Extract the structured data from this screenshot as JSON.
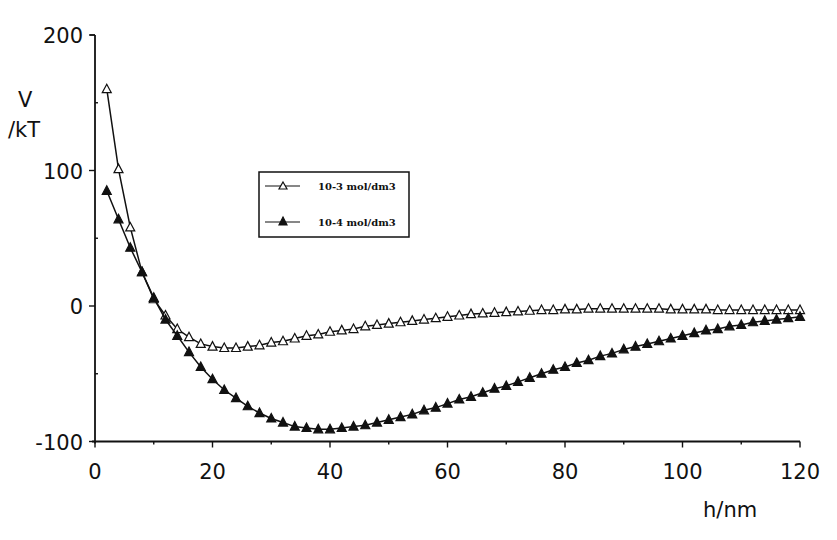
{
  "chart_data": {
    "type": "line",
    "title": "",
    "xlabel": "h/nm",
    "ylabel_line1": "V",
    "ylabel_line2": "/kT",
    "xlim": [
      0,
      120
    ],
    "ylim": [
      -100,
      200
    ],
    "xticks": [
      0,
      20,
      40,
      60,
      80,
      100,
      120
    ],
    "xtick_labels": [
      "0",
      "20",
      "40",
      "60",
      "80",
      "100",
      "120"
    ],
    "yticks": [
      -100,
      0,
      100,
      200
    ],
    "ytick_labels": [
      "-100",
      "0",
      "100",
      "200"
    ],
    "grid": false,
    "legend_position": "upper-center-left (boxed)",
    "x": [
      2,
      4,
      6,
      8,
      10,
      12,
      14,
      16,
      18,
      20,
      22,
      24,
      26,
      28,
      30,
      32,
      34,
      36,
      38,
      40,
      42,
      44,
      46,
      48,
      50,
      52,
      54,
      56,
      58,
      60,
      62,
      64,
      66,
      68,
      70,
      72,
      74,
      76,
      78,
      80,
      82,
      84,
      86,
      88,
      90,
      92,
      94,
      96,
      98,
      100,
      102,
      104,
      106,
      108,
      110,
      112,
      114,
      116,
      118,
      120
    ],
    "series": [
      {
        "name": "10-3 mol/dm3",
        "marker": "open-triangle",
        "values": [
          160,
          101,
          58,
          25,
          5,
          -7,
          -17,
          -23,
          -28,
          -30,
          -31,
          -31,
          -30,
          -29,
          -27,
          -26,
          -24,
          -22,
          -21,
          -19,
          -18,
          -17,
          -15,
          -14,
          -13,
          -12,
          -11,
          -10,
          -9,
          -8,
          -7,
          -6,
          -5.5,
          -5,
          -4.5,
          -4,
          -3.5,
          -3,
          -3,
          -2.5,
          -2.5,
          -2,
          -2,
          -2,
          -2,
          -2,
          -2,
          -2,
          -2.5,
          -2.5,
          -2.5,
          -2.5,
          -3,
          -3,
          -3,
          -3,
          -3,
          -3,
          -3,
          -3
        ]
      },
      {
        "name": "10-4 mol/dm3",
        "marker": "filled-triangle",
        "values": [
          85,
          64,
          43,
          25,
          6,
          -10,
          -22,
          -34,
          -45,
          -54,
          -62,
          -68,
          -74,
          -79,
          -83,
          -86,
          -89,
          -90,
          -91,
          -91,
          -90,
          -89,
          -88,
          -86,
          -84,
          -82,
          -80,
          -77,
          -75,
          -72,
          -69,
          -67,
          -64,
          -61,
          -59,
          -56,
          -53,
          -50,
          -47,
          -45,
          -42,
          -40,
          -37,
          -35,
          -32,
          -30,
          -28,
          -26,
          -24,
          -22,
          -20,
          -18,
          -17,
          -15,
          -14,
          -12,
          -11,
          -10,
          -9,
          -8
        ]
      }
    ]
  },
  "legend": {
    "items": [
      {
        "label": "10-3 mol/dm3",
        "marker": "open-triangle"
      },
      {
        "label": "10-4 mol/dm3",
        "marker": "filled-triangle"
      }
    ]
  },
  "colors": {
    "ink": "#111111",
    "background": "#ffffff"
  }
}
